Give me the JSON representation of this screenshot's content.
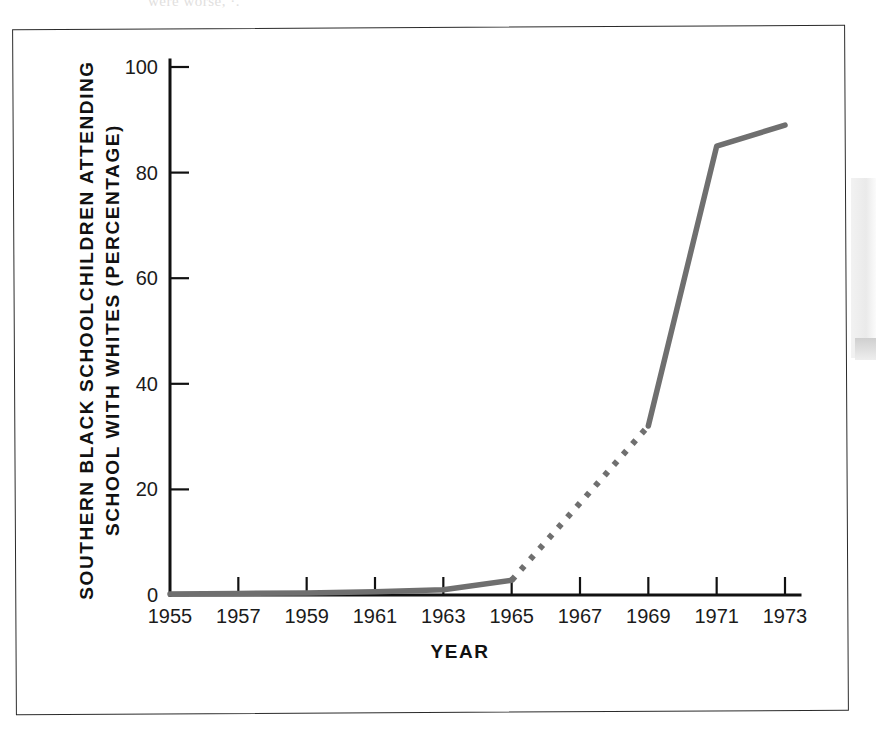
{
  "figure": {
    "scan_bleed_text": "were worse, ·.",
    "frame_color": "#2b2b2b",
    "background_color": "#ffffff"
  },
  "chart_data": {
    "type": "line",
    "title": "",
    "xlabel": "YEAR",
    "ylabel_line1": "SOUTHERN BLACK SCHOOLCHILDREN ATTENDING",
    "ylabel_line2": "SCHOOL WITH WHITES (PERCENTAGE)",
    "xlim": [
      1955,
      1973
    ],
    "ylim": [
      0,
      100
    ],
    "xticks": [
      1955,
      1957,
      1959,
      1961,
      1963,
      1965,
      1967,
      1969,
      1971,
      1973
    ],
    "xtick_labels": [
      "1955",
      "1957",
      "1959",
      "1961",
      "1963",
      "1965",
      "1967",
      "1969",
      "1971",
      "1973"
    ],
    "yticks": [
      0,
      20,
      40,
      60,
      80,
      100
    ],
    "ytick_labels": [
      "0",
      "20",
      "40",
      "60",
      "80",
      "100"
    ],
    "grid": false,
    "legend": false,
    "line_color": "#6f6f6f",
    "series": [
      {
        "name": "Southern black schoolchildren attending school with whites",
        "style": "solid",
        "x": [
          1955,
          1957,
          1959,
          1961,
          1963,
          1965
        ],
        "values": [
          0.2,
          0.3,
          0.4,
          0.6,
          1.0,
          2.8
        ]
      },
      {
        "name": "Southern black schoolchildren attending school with whites (interpolated)",
        "style": "dotted",
        "x": [
          1965,
          1969
        ],
        "values": [
          2.8,
          32.0
        ]
      },
      {
        "name": "Southern black schoolchildren attending school with whites (continued)",
        "style": "solid",
        "x": [
          1969,
          1971,
          1973
        ],
        "values": [
          32.0,
          85.0,
          89.0
        ]
      }
    ]
  }
}
